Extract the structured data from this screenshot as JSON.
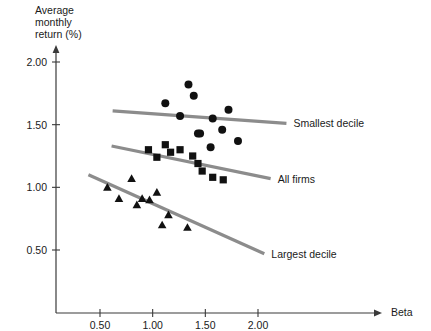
{
  "chart_data": {
    "type": "scatter",
    "title": "",
    "xlabel": "Beta",
    "ylabel": "Average monthly return (%)",
    "ylabel_lines": [
      "Average",
      "monthly",
      "return (%)"
    ],
    "xlim": [
      0.0,
      2.35
    ],
    "ylim": [
      0.0,
      2.25
    ],
    "xticks": [
      0.5,
      1.0,
      1.5,
      2.0
    ],
    "xtick_labels": [
      "0.50",
      "1.00",
      "1.50",
      "2.00"
    ],
    "yticks": [
      0.5,
      1.0,
      1.5,
      2.0
    ],
    "ytick_labels": [
      "0.50",
      "1.00",
      "1.50",
      "2.00"
    ],
    "grid": false,
    "legend_position": "right-inline",
    "marker_color": "#111111",
    "line_color": "#8c8c8c",
    "axis_color": "#3a3a3a",
    "series": [
      {
        "name": "Smallest decile",
        "label": "Smallest decile",
        "marker": "circle",
        "points": [
          {
            "x": 1.12,
            "y": 1.67
          },
          {
            "x": 1.26,
            "y": 1.57
          },
          {
            "x": 1.34,
            "y": 1.82
          },
          {
            "x": 1.39,
            "y": 1.73
          },
          {
            "x": 1.43,
            "y": 1.43
          },
          {
            "x": 1.45,
            "y": 1.43
          },
          {
            "x": 1.55,
            "y": 1.32
          },
          {
            "x": 1.57,
            "y": 1.55
          },
          {
            "x": 1.66,
            "y": 1.46
          },
          {
            "x": 1.72,
            "y": 1.62
          },
          {
            "x": 1.81,
            "y": 1.37
          }
        ],
        "fit_line": {
          "x0": 0.62,
          "y0": 1.61,
          "x1": 2.27,
          "y1": 1.51
        }
      },
      {
        "name": "All firms",
        "label": "All firms",
        "marker": "square",
        "points": [
          {
            "x": 0.96,
            "y": 1.3
          },
          {
            "x": 1.04,
            "y": 1.24
          },
          {
            "x": 1.12,
            "y": 1.34
          },
          {
            "x": 1.17,
            "y": 1.28
          },
          {
            "x": 1.26,
            "y": 1.3
          },
          {
            "x": 1.38,
            "y": 1.25
          },
          {
            "x": 1.43,
            "y": 1.19
          },
          {
            "x": 1.47,
            "y": 1.13
          },
          {
            "x": 1.57,
            "y": 1.08
          },
          {
            "x": 1.67,
            "y": 1.06
          }
        ],
        "fit_line": {
          "x0": 0.61,
          "y0": 1.33,
          "x1": 2.12,
          "y1": 1.07
        }
      },
      {
        "name": "Largest decile",
        "label": "Largest decile",
        "marker": "triangle",
        "points": [
          {
            "x": 0.57,
            "y": 1.0
          },
          {
            "x": 0.68,
            "y": 0.91
          },
          {
            "x": 0.8,
            "y": 1.07
          },
          {
            "x": 0.85,
            "y": 0.86
          },
          {
            "x": 0.9,
            "y": 0.91
          },
          {
            "x": 0.97,
            "y": 0.9
          },
          {
            "x": 1.04,
            "y": 0.96
          },
          {
            "x": 1.09,
            "y": 0.7
          },
          {
            "x": 1.15,
            "y": 0.78
          },
          {
            "x": 1.33,
            "y": 0.68
          }
        ],
        "fit_line": {
          "x0": 0.39,
          "y0": 1.1,
          "x1": 2.06,
          "y1": 0.47
        }
      }
    ]
  }
}
